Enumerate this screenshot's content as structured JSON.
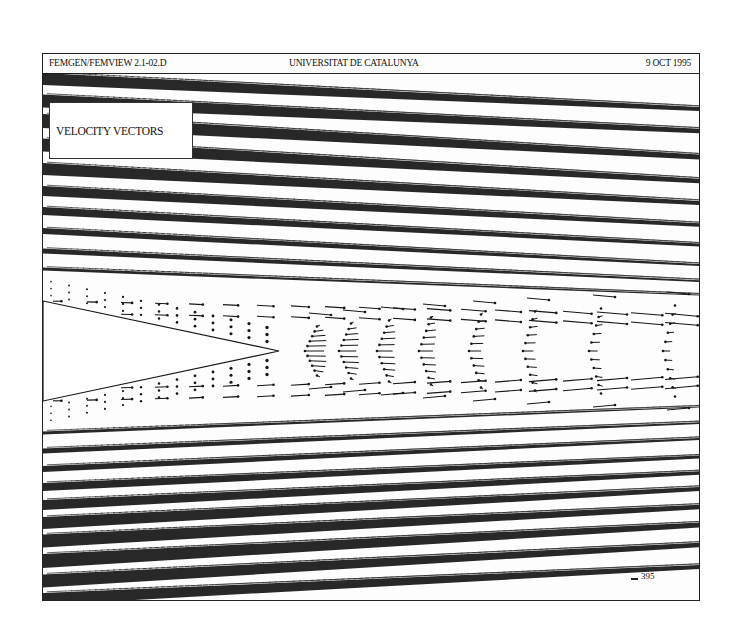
{
  "header": {
    "left": "FEMGEN/FEMVIEW 2.1-02.D",
    "center": "UNIVERSITAT DE CATALUNYA",
    "right": "9 OCT 1995"
  },
  "plot": {
    "title": "VELOCITY VECTORS",
    "scale_label": "395",
    "colors": {
      "ink": "#161616",
      "paper": "#fdfdfd",
      "frame": "#222222"
    },
    "wedge": {
      "tip": [
        236,
        278
      ],
      "top_left": [
        0,
        228
      ],
      "bottom_left": [
        0,
        328
      ]
    },
    "bands_top": [
      {
        "y0": 6,
        "y1": 36,
        "thick": 12
      },
      {
        "y0": 28,
        "y1": 58,
        "thick": 13
      },
      {
        "y0": 48,
        "y1": 84,
        "thick": 14
      },
      {
        "y0": 72,
        "y1": 108,
        "thick": 13
      },
      {
        "y0": 96,
        "y1": 130,
        "thick": 12
      },
      {
        "y0": 118,
        "y1": 152,
        "thick": 10
      },
      {
        "y0": 138,
        "y1": 172,
        "thick": 8
      },
      {
        "y0": 158,
        "y1": 192,
        "thick": 6
      },
      {
        "y0": 178,
        "y1": 208,
        "thick": 5
      },
      {
        "y0": 196,
        "y1": 222,
        "thick": 3
      }
    ],
    "bands_bottom": [
      {
        "y0": 360,
        "y1": 334,
        "thick": 3
      },
      {
        "y0": 378,
        "y1": 350,
        "thick": 5
      },
      {
        "y0": 396,
        "y1": 366,
        "thick": 6
      },
      {
        "y0": 414,
        "y1": 384,
        "thick": 8
      },
      {
        "y0": 432,
        "y1": 400,
        "thick": 10
      },
      {
        "y0": 450,
        "y1": 416,
        "thick": 12
      },
      {
        "y0": 468,
        "y1": 434,
        "thick": 13
      },
      {
        "y0": 488,
        "y1": 452,
        "thick": 14
      },
      {
        "y0": 508,
        "y1": 472,
        "thick": 13
      },
      {
        "y0": 526,
        "y1": 494,
        "thick": 12
      }
    ],
    "vortex_columns_x": [
      262,
      296,
      334,
      376,
      426,
      480,
      546,
      620
    ],
    "center_y": 278
  }
}
